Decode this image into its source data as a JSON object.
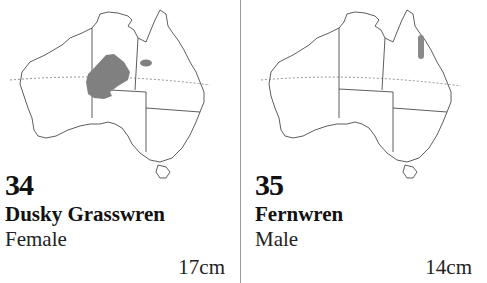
{
  "entries": [
    {
      "number": "34",
      "name": "Dusky Grasswren",
      "sex": "Female",
      "size": "17cm",
      "range_color": "#808080",
      "map_icon": "australia-range-map"
    },
    {
      "number": "35",
      "name": "Fernwren",
      "sex": "Male",
      "size": "14cm",
      "range_color": "#8a8a8a",
      "map_icon": "australia-range-map"
    }
  ]
}
